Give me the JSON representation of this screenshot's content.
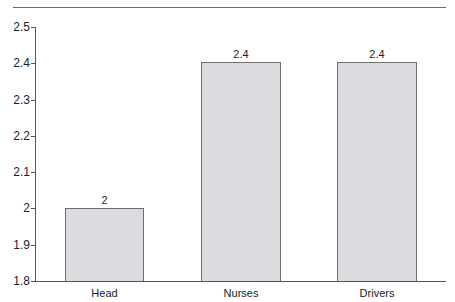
{
  "chart_data": {
    "type": "bar",
    "title": "",
    "xlabel": "",
    "ylabel": "",
    "categories": [
      "Head",
      "Nurses",
      "Drivers"
    ],
    "values": [
      2,
      2.4,
      2.4
    ],
    "data_labels": [
      "2",
      "2.4",
      "2.4"
    ],
    "ylim": [
      1.8,
      2.5
    ],
    "yticks": [
      "2.5",
      "2.4",
      "2.3",
      "2.2",
      "2.1",
      "2",
      "1.9",
      "1.8"
    ],
    "grid": false,
    "legend": null,
    "bar_color": "#dcdce0",
    "bar_edge_color": "#6e6e6e"
  }
}
